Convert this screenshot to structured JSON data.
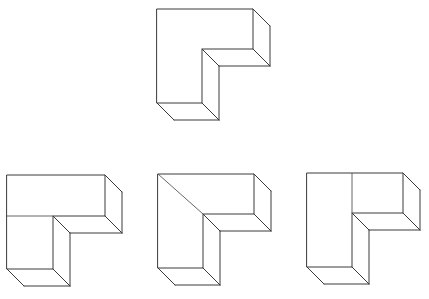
{
  "diagram": {
    "title": "",
    "stroke_color": "#3a3a3a",
    "background": "#ffffff",
    "depth_offset": [
      17,
      17
    ],
    "figures": [
      {
        "id": "reference",
        "role": "reference-shape",
        "label": "",
        "front_face": [
          [
            157,
            9
          ],
          [
            253,
            9
          ],
          [
            253,
            49
          ],
          [
            202,
            49
          ],
          [
            202,
            103
          ],
          [
            157,
            103
          ]
        ],
        "internal_lines": []
      },
      {
        "id": "option-1",
        "role": "answer-option",
        "label": "",
        "front_face": [
          [
            7,
            175
          ],
          [
            105,
            175
          ],
          [
            105,
            216
          ],
          [
            53,
            216
          ],
          [
            53,
            269
          ],
          [
            7,
            269
          ]
        ],
        "internal_lines": [
          [
            [
              7,
              216
            ],
            [
              53,
              216
            ]
          ]
        ]
      },
      {
        "id": "option-2",
        "role": "answer-option",
        "label": "",
        "front_face": [
          [
            158,
            174
          ],
          [
            254,
            174
          ],
          [
            254,
            214
          ],
          [
            203,
            214
          ],
          [
            203,
            268
          ],
          [
            158,
            268
          ]
        ],
        "internal_lines": [
          [
            [
              158,
              174
            ],
            [
              203,
              214
            ]
          ]
        ]
      },
      {
        "id": "option-3",
        "role": "answer-option",
        "label": "",
        "front_face": [
          [
            307,
            173
          ],
          [
            403,
            173
          ],
          [
            403,
            213
          ],
          [
            352,
            213
          ],
          [
            352,
            267
          ],
          [
            307,
            267
          ]
        ],
        "internal_lines": [
          [
            [
              352,
              173
            ],
            [
              352,
              213
            ]
          ]
        ]
      }
    ]
  }
}
